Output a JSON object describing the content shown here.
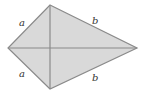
{
  "diagram": {
    "type": "kite",
    "fill_color": "#d9d9d9",
    "stroke_color": "#8a8a8a",
    "vertices": {
      "top": [
        50,
        5
      ],
      "left": [
        8,
        48
      ],
      "right": [
        137,
        48
      ],
      "bottom": [
        50,
        89
      ]
    },
    "labels": {
      "upper_left": "a",
      "lower_left": "a",
      "upper_right": "b",
      "lower_right": "b"
    }
  }
}
